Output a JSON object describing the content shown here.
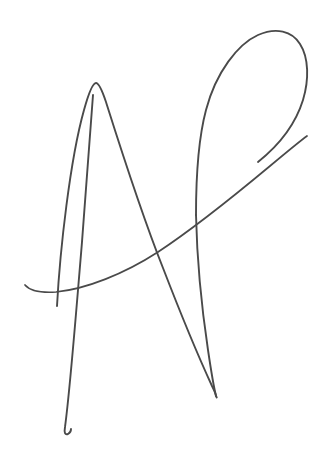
{
  "document": {
    "type": "handwritten-signature",
    "title": "Handwritten signature",
    "description": "A single continuous flowing pen stroke forming a cursive monogram resembling the letters A and P",
    "width": 322,
    "height": 467,
    "background_color": "#ffffff",
    "text_content": ""
  },
  "ink": {
    "stroke_color": "#4a4a4a",
    "stroke_color_light": "#585858",
    "stroke_width": 1.9,
    "stroke_width_thin": 1.4,
    "stroke_width_thick": 2.3,
    "opacity": 1
  },
  "strokes": [
    {
      "name": "a-ascender-and-right-leg",
      "description": "Rises from lower left to a rounded apex, then descends in a long bowed curve to the sharp bottom point",
      "path": "M 57 306 C 60 250 70 160 84 110 C 89 92 93 83 96 83 C 99 83 102 90 106 102 C 118 140 140 210 163 268 C 180 312 200 360 212 386 C 215 392 216 395 216 396",
      "width": 1.9
    },
    {
      "name": "a-vertical-descender",
      "description": "Long near-vertical tail dropping from the apex area down to a small rightward hook at the bottom",
      "path": "M 93 95 C 90 140 84 220 78 290 C 73 350 68 405 65 427 C 64 433 65 435 68 434 C 70 433 71 431 71 429",
      "width": 1.9
    },
    {
      "name": "p-loop-upper",
      "description": "Large sweeping loop rising from mid-left up over the top right and curving back down the right side",
      "path": "M 196 215 C 196 180 198 140 206 110 C 216 72 238 44 258 35 C 276 27 292 31 300 44 C 309 58 309 80 303 100 C 295 126 278 146 258 162",
      "width": 1.9
    },
    {
      "name": "p-loop-descender",
      "description": "Descends from the loop left side down to the sharp bottom V point",
      "path": "M 196 215 C 197 260 202 310 208 350 C 212 377 215 392 216 396 C 217 398 217 398 216 396",
      "width": 1.9
    },
    {
      "name": "crossbar-sweep",
      "description": "Long flat crossbar beginning with a tapered upturned tip at the far left, sweeping right and rising steeply",
      "path": "M 25 285 C 30 291 40 293 56 292 C 86 289 124 274 158 252 C 196 227 240 191 270 166 C 288 151 300 141 307 136",
      "width": 1.7
    }
  ],
  "colors": {
    "background": "#ffffff",
    "ink": "#4a4a4a"
  }
}
